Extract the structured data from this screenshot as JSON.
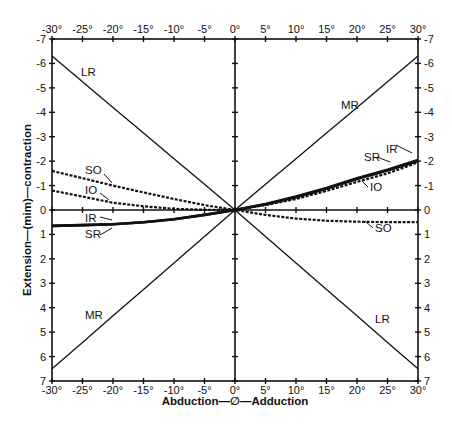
{
  "chart_data": {
    "type": "line",
    "title": "",
    "xlabel": "Abduction—∅—Adduction",
    "ylabel": "Extension—(mim)—contraction",
    "xlim": [
      -30,
      30
    ],
    "ylim": [
      -7,
      7
    ],
    "y_inverted": true,
    "grid": false,
    "axes_through_origin": true,
    "x_ticks": [
      -30,
      -25,
      -20,
      -15,
      -10,
      -5,
      0,
      5,
      10,
      15,
      20,
      25,
      30
    ],
    "x_tick_labels": [
      "-30°",
      "-25°",
      "-20°",
      "-15°",
      "-10°",
      "-5°",
      "0°",
      "5°",
      "10°",
      "15°",
      "20°",
      "25°",
      "30°"
    ],
    "y_ticks": [
      -7,
      -6,
      -5,
      -4,
      -3,
      -2,
      -1,
      0,
      1,
      2,
      3,
      4,
      5,
      6,
      7
    ],
    "y_tick_labels": [
      "-7",
      "-6",
      "-5",
      "-4",
      "-3",
      "-2",
      "-1",
      "0",
      "1",
      "2",
      "3",
      "4",
      "5",
      "6",
      "7"
    ],
    "x": [
      -30,
      -25,
      -20,
      -15,
      -10,
      -5,
      0,
      5,
      10,
      15,
      20,
      25,
      30
    ],
    "series": [
      {
        "name": "LR",
        "style": "solid-thin",
        "values": [
          -6.3,
          -5.25,
          -4.2,
          -3.15,
          -2.1,
          -1.05,
          0,
          1.08,
          2.17,
          3.25,
          4.33,
          5.42,
          6.5
        ]
      },
      {
        "name": "MR",
        "style": "solid-thin",
        "values": [
          6.5,
          5.42,
          4.33,
          3.25,
          2.17,
          1.08,
          0,
          -1.05,
          -2.1,
          -3.15,
          -4.2,
          -5.25,
          -6.3
        ]
      },
      {
        "name": "SO",
        "style": "dashed",
        "values": [
          -1.6,
          -1.3,
          -1.0,
          -0.72,
          -0.45,
          -0.2,
          0,
          0.2,
          0.35,
          0.44,
          0.48,
          0.5,
          0.5
        ]
      },
      {
        "name": "IO",
        "style": "dashed",
        "values": [
          -0.8,
          -0.55,
          -0.3,
          -0.15,
          -0.05,
          -0.01,
          0,
          -0.2,
          -0.45,
          -0.78,
          -1.15,
          -1.5,
          -1.95
        ]
      },
      {
        "name": "IR",
        "style": "solid-thick",
        "values": [
          0.65,
          0.62,
          0.58,
          0.5,
          0.38,
          0.2,
          0,
          -0.25,
          -0.55,
          -0.9,
          -1.3,
          -1.65,
          -2.05
        ]
      },
      {
        "name": "SR",
        "style": "solid-thick",
        "values": [
          0.65,
          0.62,
          0.58,
          0.5,
          0.38,
          0.2,
          0,
          -0.23,
          -0.52,
          -0.87,
          -1.27,
          -1.62,
          -2.0
        ]
      }
    ],
    "annotations": [
      {
        "text": "LR",
        "x": -25,
        "y": -5.4
      },
      {
        "text": "MR",
        "x": 19,
        "y": -4.4
      },
      {
        "text": "SO",
        "x": -25.5,
        "y": -1.6
      },
      {
        "text": "IO",
        "x": -25.5,
        "y": -0.6
      },
      {
        "text": "IR",
        "x": -25.5,
        "y": 0.4
      },
      {
        "text": "SR",
        "x": -25.5,
        "y": 0.95
      },
      {
        "text": "SR",
        "x": 17.5,
        "y": -1.85
      },
      {
        "text": "IR",
        "x": 26.5,
        "y": -2.45
      },
      {
        "text": "IO",
        "x": 20.5,
        "y": -0.85
      },
      {
        "text": "SO",
        "x": 21,
        "y": 0.95
      },
      {
        "text": "MR",
        "x": -24.5,
        "y": 4.85
      },
      {
        "text": "LR",
        "x": 22,
        "y": 4.85
      }
    ]
  },
  "labels": {
    "x_axis_title": "Abduction—∅—Adduction",
    "y_axis_title": "Extension—(mim)—contraction",
    "lr_top": "LR",
    "mr_top": "MR",
    "so_left": "SO",
    "io_left": "IO",
    "ir_left": "IR",
    "sr_left": "SR",
    "sr_right": "SR",
    "ir_right": "IR",
    "io_right": "IO",
    "so_right": "SO",
    "mr_bottom": "MR",
    "lr_bottom": "LR"
  }
}
